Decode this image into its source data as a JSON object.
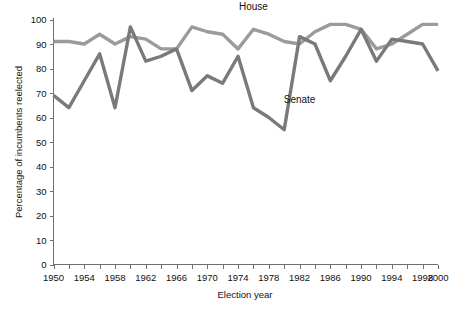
{
  "chart_data": {
    "type": "line",
    "title": "",
    "xlabel": "Election year",
    "ylabel": "Percentage of incumbents reelected",
    "xlim": [
      1950,
      2000
    ],
    "ylim": [
      0,
      100
    ],
    "grid": false,
    "legend_position": "inline-annotations",
    "x": [
      1950,
      1952,
      1954,
      1956,
      1958,
      1960,
      1962,
      1964,
      1966,
      1968,
      1970,
      1972,
      1974,
      1976,
      1978,
      1980,
      1982,
      1984,
      1986,
      1988,
      1990,
      1992,
      1994,
      1996,
      1998,
      2000
    ],
    "xticks": [
      1950,
      1952,
      1954,
      1956,
      1958,
      1960,
      1962,
      1964,
      1966,
      1968,
      1970,
      1972,
      1974,
      1976,
      1978,
      1980,
      1982,
      1984,
      1986,
      1988,
      1990,
      1992,
      1994,
      1996,
      1998,
      2000
    ],
    "xtick_labels": [
      "1950",
      "1954",
      "1958",
      "1962",
      "1966",
      "1970",
      "1974",
      "1978",
      "1982",
      "1986",
      "1990",
      "1994",
      "1998",
      "2000"
    ],
    "xtick_labeled_values": [
      1950,
      1954,
      1958,
      1962,
      1966,
      1970,
      1974,
      1978,
      1982,
      1986,
      1990,
      1994,
      1998,
      2000
    ],
    "yticks": [
      0,
      10,
      20,
      30,
      40,
      50,
      60,
      70,
      80,
      90,
      100
    ],
    "ytick_labels": [
      "0",
      "10",
      "20",
      "30",
      "40",
      "50",
      "60",
      "70",
      "80",
      "90",
      "100"
    ],
    "series": [
      {
        "name": "House",
        "color": "#9b9b9b",
        "label_x": 1976,
        "label_y": 104,
        "values": [
          91,
          91,
          90,
          94,
          90,
          93,
          92,
          88,
          88,
          97,
          95,
          94,
          88,
          96,
          94,
          91,
          90,
          95,
          98,
          98,
          96,
          88,
          90,
          94,
          98,
          98
        ]
      },
      {
        "name": "Senate",
        "color": "#7a7a7a",
        "label_x": 1982,
        "label_y": 66,
        "values": [
          69,
          64,
          75,
          86,
          64,
          97,
          83,
          85,
          88,
          71,
          77,
          74,
          85,
          64,
          60,
          55,
          93,
          90,
          75,
          85,
          96,
          83,
          92,
          91,
          90,
          79
        ]
      }
    ]
  },
  "annotations": {
    "house_label": "House",
    "senate_label": "Senate"
  }
}
